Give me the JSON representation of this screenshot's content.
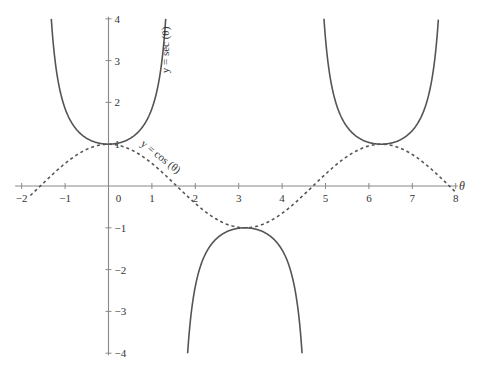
{
  "chart_data": {
    "type": "line",
    "title": "",
    "xlabel": "θ",
    "ylabel": "",
    "xlim": [
      -2,
      8
    ],
    "ylim": [
      -4,
      4
    ],
    "grid": false,
    "legend": "none (inline curve labels)",
    "x_ticks": [
      -2,
      -1,
      0,
      1,
      2,
      3,
      4,
      5,
      6,
      7,
      8
    ],
    "y_ticks": [
      -4,
      -3,
      -2,
      -1,
      1,
      2,
      3,
      4
    ],
    "x_tick_labels": [
      "−2",
      "−1",
      "0",
      "1",
      "2",
      "3",
      "4",
      "5",
      "6",
      "7",
      "8"
    ],
    "y_tick_labels": [
      "−4",
      "−3",
      "−2",
      "−1",
      "1",
      "2",
      "3",
      "4"
    ],
    "series": [
      {
        "name": "y = sec (θ)",
        "style": "solid",
        "color": "#555555",
        "function": "sec(x)",
        "branches": [
          [
            -1.318,
            1.318
          ],
          [
            1.823,
            4.46
          ],
          [
            4.965,
            7.6
          ]
        ],
        "sample_points": [
          [
            0,
            1
          ],
          [
            1.047,
            2
          ],
          [
            3.1416,
            -1
          ],
          [
            6.2832,
            1
          ],
          [
            -1.047,
            2
          ]
        ]
      },
      {
        "name": "y = cos (θ)",
        "style": "dashed",
        "color": "#555555",
        "function": "cos(x)",
        "domain": [
          -1.8,
          8
        ],
        "sample_points": [
          [
            0,
            1
          ],
          [
            1.5708,
            0
          ],
          [
            3.1416,
            -1
          ],
          [
            4.7124,
            0
          ],
          [
            6.2832,
            1
          ],
          [
            8,
            -0.146
          ]
        ]
      }
    ],
    "annotations": [
      {
        "text": "y = sec (θ)",
        "near": [
          1.25,
          3.3
        ],
        "rotation": -90
      },
      {
        "text": "y = cos (θ)",
        "near": [
          0.9,
          0.6
        ],
        "rotation": 38
      }
    ]
  },
  "labels": {
    "x_axis_name": "θ",
    "sec_label": "y = sec (θ)",
    "cos_label": "y = cos (θ)"
  }
}
